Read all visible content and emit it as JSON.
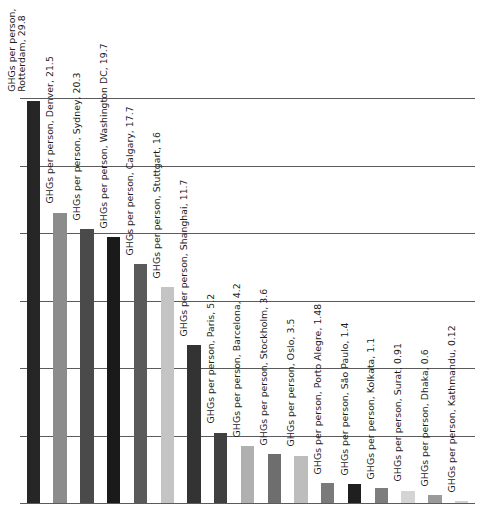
{
  "chart_data": {
    "type": "bar",
    "title": "",
    "subtitle": "",
    "xlabel": "",
    "ylabel": "",
    "ylim": [
      0,
      30
    ],
    "grid": true,
    "gridline_values": [
      30,
      25,
      20,
      15,
      10,
      5
    ],
    "legend": "none",
    "label_orientation": "vertical",
    "label_template": "GHGs per person, {city}, {value}",
    "categories": [
      "Rotterdam",
      "Denver",
      "Sydney",
      "Washington DC",
      "Calgary",
      "Stuttgart",
      "Shanghai",
      "Paris",
      "Barcelona",
      "Stockholm",
      "Oslo",
      "Porto Alegre",
      "São Paulo",
      "Kolkata",
      "Surat",
      "Dhaka",
      "Kathmandu"
    ],
    "values": [
      29.8,
      21.5,
      20.3,
      19.7,
      17.7,
      16,
      11.7,
      5.2,
      4.2,
      3.6,
      3.5,
      1.48,
      1.4,
      1.1,
      0.91,
      0.6,
      0.12
    ],
    "bar_colors": [
      "#262626",
      "#8c8c8c",
      "#4a4a4a",
      "#1a1a1a",
      "#5a5a5a",
      "#c4c4c4",
      "#333333",
      "#404040",
      "#b0b0b0",
      "#6e6e6e",
      "#bdbdbd",
      "#7a7a7a",
      "#1f1f1f",
      "#7d7d7d",
      "#d4d4d4",
      "#9a9a9a",
      "#cfcfcf"
    ],
    "data_labels": [
      "GHGs per person, Rotterdam, 29.8",
      "GHGs per person, Denver, 21.5",
      "GHGs per person, Sydney, 20.3",
      "GHGs per person, Washington DC, 19.7",
      "GHGs per person, Calgary, 17.7",
      "GHGs per person, Stuttgart, 16",
      "GHGs per person, Shanghai, 11.7",
      "GHGs per person, Paris, 5.2",
      "GHGs per person, Barcelona, 4.2",
      "GHGs per person, Stockholm, 3.6",
      "GHGs per person, Oslo, 3.5",
      "GHGs per person, Porto Alegre, 1.48",
      "GHGs per person, São Paulo, 1.4",
      "GHGs per person, Kolkata, 1.1",
      "GHGs per person, Surat, 0.91",
      "GHGs per person, Dhaka, 0.6",
      "GHGs per person, Kathmandu, 0.12"
    ]
  },
  "style": {
    "gridline_color": "#5b5b5b",
    "axis_color": "#5b5b5b",
    "background": "#ffffff",
    "label_color": "#1b1b1b"
  }
}
